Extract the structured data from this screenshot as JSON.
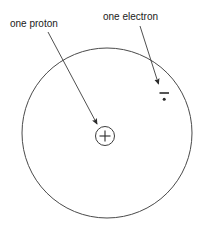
{
  "diagram": {
    "background_color": "#ffffff",
    "stroke_color": "#3c3c3c",
    "text_color": "#1a1a1a",
    "labels": {
      "proton": "one proton",
      "electron": "one electron"
    },
    "symbols": {
      "proton_charge": "+",
      "electron_charge": "−"
    },
    "shapes": {
      "orbit": {
        "cx": 107,
        "cy": 133,
        "r": 85
      },
      "nucleus": {
        "cx": 105,
        "cy": 136,
        "r": 9.5
      },
      "electron_point": {
        "cx": 164,
        "cy": 99,
        "r": 1.4
      },
      "electron_bar": {
        "x1": 160,
        "y1": 93,
        "x2": 169,
        "y2": 93
      }
    },
    "arrows": {
      "proton_arrow": {
        "x1": 48,
        "y1": 32,
        "x2": 98,
        "y2": 126
      },
      "electron_arrow": {
        "x1": 140,
        "y1": 26,
        "x2": 159,
        "y2": 86
      }
    }
  }
}
